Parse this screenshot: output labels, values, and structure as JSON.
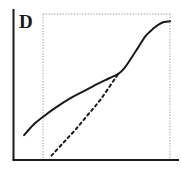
{
  "figure": {
    "panel_label": "D",
    "background_color": "#ffffff"
  },
  "chart_data": {
    "type": "line",
    "title": "D",
    "subtitle": "",
    "xlabel": "",
    "ylabel": "",
    "xlim": [
      0,
      1
    ],
    "ylim": [
      0,
      1
    ],
    "grid": false,
    "axes": {
      "y_axis_style": "solid",
      "x_axis_style": "solid",
      "axis_color": "#1a1a1a",
      "tick_labels_x": [],
      "tick_labels_y": [],
      "plot_frame_style": "dotted",
      "plot_frame_color": "#b5b5b5"
    },
    "legend": {
      "visible": false,
      "position": "none",
      "entries": [
        "solid curve",
        "dashed curve"
      ]
    },
    "annotations": [],
    "series": [
      {
        "name": "solid curve",
        "style": "solid",
        "color": "#1a1a1a",
        "linewidth": 2,
        "x": [
          0.04,
          0.1,
          0.17,
          0.25,
          0.34,
          0.43,
          0.52,
          0.6,
          0.66,
          0.7,
          0.74,
          0.79,
          0.84,
          0.89,
          0.93,
          0.96,
          1.0
        ],
        "y": [
          0.17,
          0.24,
          0.3,
          0.36,
          0.42,
          0.47,
          0.52,
          0.56,
          0.59,
          0.63,
          0.69,
          0.77,
          0.85,
          0.9,
          0.93,
          0.945,
          0.95
        ]
      },
      {
        "name": "dashed curve",
        "style": "dashed",
        "color": "#1a1a1a",
        "linewidth": 2,
        "x": [
          0.22,
          0.3,
          0.38,
          0.46,
          0.54,
          0.62,
          0.66
        ],
        "y": [
          0.03,
          0.12,
          0.21,
          0.31,
          0.41,
          0.53,
          0.59
        ]
      }
    ]
  }
}
